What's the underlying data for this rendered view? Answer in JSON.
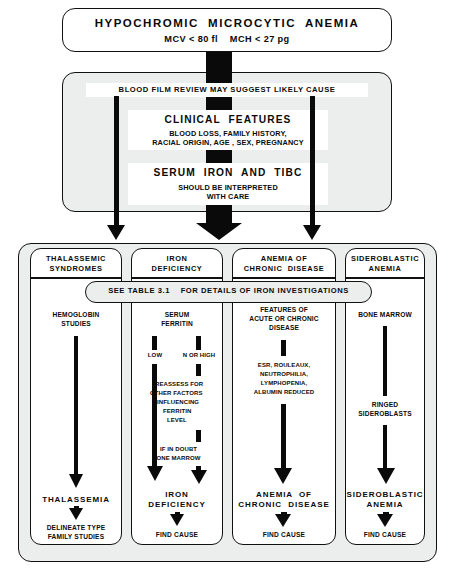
{
  "figure": {
    "type": "flowchart"
  },
  "top": {
    "title": "HYPOCHROMIC  MICROCYTIC  ANEMIA",
    "criteria": "MCV < 80 fl    MCH < 27 pg"
  },
  "middle": {
    "blood_film_band": "BLOOD FILM REVIEW MAY SUGGEST LIKELY CAUSE",
    "clinical_features_heading": "CLINICAL  FEATURES",
    "clinical_features_line1": "BLOOD LOSS, FAMILY HISTORY,",
    "clinical_features_line2": "RACIAL ORIGIN, AGE , SEX, PREGNANCY",
    "serum_iron_heading": "SERUM  IRON  AND  TIBC",
    "serum_iron_line1": "SHOULD BE INTERPRETED",
    "serum_iron_line2": "WITH CARE"
  },
  "table_band": "SEE TABLE 3.1    FOR DETAILS OF IRON INVESTIGATIONS",
  "columns": [
    {
      "header_line1": "THALASSEMIC",
      "header_line2": "SYNDROMES",
      "test_line1": "HEMOGLOBIN",
      "test_line2": "STUDIES",
      "result": "THALASSEMIA",
      "final_line1": "DELINEATE TYPE",
      "final_line2": "FAMILY STUDIES"
    },
    {
      "header_line1": "IRON",
      "header_line2": "DEFICIENCY",
      "test_line1": "SERUM",
      "test_line2": "FERRITIN",
      "branch_left": "LOW",
      "branch_right": "N OR HIGH",
      "reassess_line1": "REASSESS FOR",
      "reassess_line2": "OTHER FACTORS",
      "reassess_line3": "INFLUENCING",
      "reassess_line4": "FERRITIN",
      "reassess_line5": "LEVEL",
      "doubt_line1": "IF IN DOUBT",
      "doubt_line2": "BONE MARROW",
      "result_line1": "IRON",
      "result_line2": "DEFICIENCY",
      "final_line1": "FIND CAUSE"
    },
    {
      "header_line1": "ANEMIA OF",
      "header_line2": "CHRONIC  DISEASE",
      "test_line1": "FEATURES OF",
      "test_line2": "ACUTE OR CHRONIC",
      "test_line3": "DISEASE",
      "findings_line1": "ESR, ROULEAUX,",
      "findings_line2": "NEUTROPHILIA,",
      "findings_line3": "LYMPHOPENIA,",
      "findings_line4": "ALBUMIN REDUCED",
      "result_line1": "ANEMIA  OF",
      "result_line2": "CHRONIC  DISEASE",
      "final_line1": "FIND CAUSE"
    },
    {
      "header_line1": "SIDEROBLASTIC",
      "header_line2": "ANEMIA",
      "test_line1": "BONE MARROW",
      "findings_line1": "RINGED",
      "findings_line2": "SIDEROBLASTS",
      "result_line1": "SIDEROBLASTIC",
      "result_line2": "ANEMIA",
      "final_line1": "FIND CAUSE"
    }
  ],
  "colors": {
    "ink": "#0a0a0a",
    "panel_fill": "#eceded",
    "paper": "#ffffff"
  }
}
